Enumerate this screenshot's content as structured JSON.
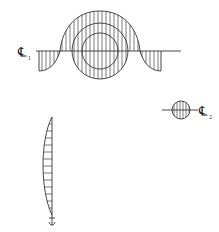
{
  "diagram": {
    "type": "engineering-stress-distribution-sketch",
    "stroke_color": "#333333",
    "background": "#ffffff",
    "labels": {
      "centerline_1": "℄",
      "centerline_1_sub": "1",
      "centerline_2": "℄",
      "centerline_2_sub": "2"
    },
    "figures": [
      {
        "name": "main-distribution",
        "desc": "Central positive lobe with two concentric circles and negative side lobes, vertically hatched, on centerline 1"
      },
      {
        "name": "small-circle",
        "desc": "Small vertically hatched circle on centerline 2"
      },
      {
        "name": "lens-distribution",
        "desc": "Vertical lens-shaped distribution with horizontal hatching"
      }
    ]
  }
}
